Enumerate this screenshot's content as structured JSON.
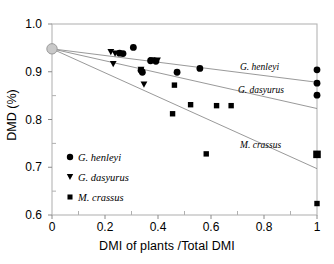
{
  "chart_data": {
    "type": "scatter",
    "title": "",
    "xlabel": "DMI of plants /Total DMI",
    "ylabel": "DMD (%)",
    "xlim": [
      0,
      1
    ],
    "ylim": [
      0.6,
      1.0
    ],
    "xticks": [
      0,
      0.2,
      0.4,
      0.6,
      0.8,
      1
    ],
    "xtick_labels": [
      "0",
      "0.2",
      "0.4",
      "0.6",
      "0.8",
      "1"
    ],
    "yticks": [
      0.6,
      0.7,
      0.8,
      0.9,
      1.0
    ],
    "ytick_labels": [
      "0.6",
      "0.7",
      "0.8",
      "0.9",
      "1.0"
    ],
    "minor_ticks": true,
    "grid": false,
    "legend_position": "lower-left-inside",
    "origin_point": {
      "name": "control-origin",
      "x": 0,
      "y": 0.948,
      "marker": "circle-open-gray",
      "color": "#c9c9c9"
    },
    "series": [
      {
        "name": "G. henleyi",
        "marker": "circle",
        "color": "#000000",
        "line_label": "G. henleyi",
        "trend_from": [
          0,
          0.948
        ],
        "trend_to": [
          1,
          0.878
        ],
        "points": [
          {
            "x": 0.255,
            "y": 0.939
          },
          {
            "x": 0.268,
            "y": 0.938
          },
          {
            "x": 0.307,
            "y": 0.951
          },
          {
            "x": 0.336,
            "y": 0.903
          },
          {
            "x": 0.341,
            "y": 0.899
          },
          {
            "x": 0.372,
            "y": 0.923
          },
          {
            "x": 0.392,
            "y": 0.922
          },
          {
            "x": 0.472,
            "y": 0.899
          },
          {
            "x": 0.558,
            "y": 0.907
          },
          {
            "x": 1.0,
            "y": 0.904
          },
          {
            "x": 1.0,
            "y": 0.876
          },
          {
            "x": 1.0,
            "y": 0.851
          }
        ]
      },
      {
        "name": "G. dasyurus",
        "marker": "triangle-down",
        "color": "#000000",
        "line_label": "G. dasyurus",
        "trend_from": [
          0,
          0.948
        ],
        "trend_to": [
          1,
          0.823
        ],
        "points": [
          {
            "x": 0.222,
            "y": 0.941
          },
          {
            "x": 0.238,
            "y": 0.938
          },
          {
            "x": 0.231,
            "y": 0.916
          },
          {
            "x": 0.336,
            "y": 0.904
          },
          {
            "x": 0.347,
            "y": 0.873
          },
          {
            "x": 0.378,
            "y": 0.924
          },
          {
            "x": 0.398,
            "y": 0.923
          }
        ]
      },
      {
        "name": "M. crassus",
        "marker": "square",
        "color": "#000000",
        "line_label": "M. crassus",
        "trend_from": [
          0,
          0.948
        ],
        "trend_to": [
          1,
          0.697
        ],
        "points": [
          {
            "x": 0.462,
            "y": 0.872
          },
          {
            "x": 0.455,
            "y": 0.812
          },
          {
            "x": 0.523,
            "y": 0.831
          },
          {
            "x": 0.621,
            "y": 0.829
          },
          {
            "x": 0.676,
            "y": 0.829
          },
          {
            "x": 0.582,
            "y": 0.728
          },
          {
            "x": 1.0,
            "y": 0.727
          },
          {
            "x": 1.0,
            "y": 0.624
          }
        ]
      }
    ],
    "legend": [
      {
        "label": "G. henleyi",
        "marker": "circle"
      },
      {
        "label": "G. dasyurus",
        "marker": "triangle-down"
      },
      {
        "label": "M. crassus",
        "marker": "square"
      }
    ]
  }
}
